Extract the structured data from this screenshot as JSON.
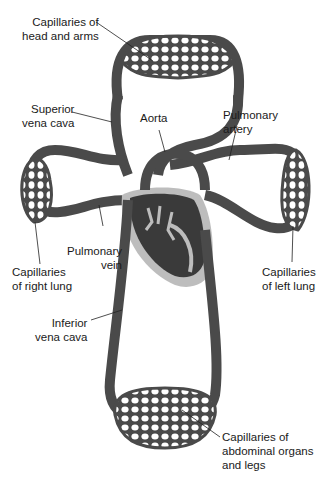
{
  "labels": {
    "capillaries_head": {
      "line1": "Capillaries of",
      "line2": "head and arms"
    },
    "superior_vena_cava": {
      "line1": "Superior",
      "line2": "vena cava"
    },
    "aorta": {
      "line1": "Aorta"
    },
    "pulmonary_artery": {
      "line1": "Pulmonary",
      "line2": "artery"
    },
    "pulmonary_vein": {
      "line1": "Pulmonary",
      "line2": "vein"
    },
    "capillaries_right_lung": {
      "line1": "Capillaries",
      "line2": "of right lung"
    },
    "capillaries_left_lung": {
      "line1": "Capillaries",
      "line2": "of left lung"
    },
    "inferior_vena_cava": {
      "line1": "Inferior",
      "line2": "vena cava"
    },
    "capillaries_abdominal": {
      "line1": "Capillaries of",
      "line2": "abdominal organs",
      "line3": "and legs"
    }
  },
  "colors": {
    "vessel": "#4a4a4a",
    "vessel_highlight": "#6a6a6a",
    "heart": "#3a3a3a",
    "heart_outline": "#bdbdbd",
    "leader_line": "#222222"
  }
}
